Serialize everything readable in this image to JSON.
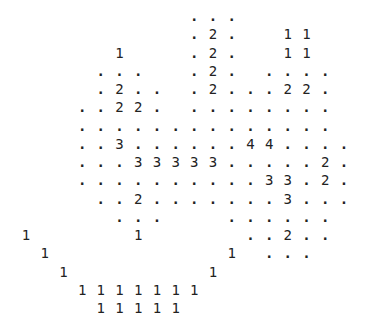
{
  "grid": {
    "origin_x": 26,
    "origin_y": 16,
    "col_pitch": 18.7,
    "row_pitch": 18.25,
    "rows": [
      {
        "cells": [
          [
            9,
            "."
          ],
          [
            10,
            "."
          ],
          [
            11,
            "."
          ]
        ]
      },
      {
        "cells": [
          [
            9,
            "."
          ],
          [
            10,
            "2"
          ],
          [
            11,
            "."
          ],
          [
            14,
            "1"
          ],
          [
            15,
            "1"
          ]
        ]
      },
      {
        "cells": [
          [
            5,
            "1"
          ],
          [
            9,
            "."
          ],
          [
            10,
            "2"
          ],
          [
            11,
            "."
          ],
          [
            14,
            "1"
          ],
          [
            15,
            "1"
          ]
        ]
      },
      {
        "cells": [
          [
            4,
            "."
          ],
          [
            5,
            "."
          ],
          [
            6,
            "."
          ],
          [
            9,
            "."
          ],
          [
            10,
            "2"
          ],
          [
            11,
            "."
          ],
          [
            13,
            "."
          ],
          [
            14,
            "."
          ],
          [
            15,
            "."
          ],
          [
            16,
            "."
          ]
        ]
      },
      {
        "cells": [
          [
            4,
            "."
          ],
          [
            5,
            "2"
          ],
          [
            6,
            "."
          ],
          [
            7,
            "."
          ],
          [
            9,
            "."
          ],
          [
            10,
            "2"
          ],
          [
            11,
            "."
          ],
          [
            12,
            "."
          ],
          [
            13,
            "."
          ],
          [
            14,
            "2"
          ],
          [
            15,
            "2"
          ],
          [
            16,
            "."
          ]
        ]
      },
      {
        "cells": [
          [
            3,
            "."
          ],
          [
            4,
            "."
          ],
          [
            5,
            "2"
          ],
          [
            6,
            "2"
          ],
          [
            7,
            "."
          ],
          [
            9,
            "."
          ],
          [
            10,
            "."
          ],
          [
            11,
            "."
          ],
          [
            12,
            "."
          ],
          [
            13,
            "."
          ],
          [
            14,
            "."
          ],
          [
            15,
            "."
          ],
          [
            16,
            "."
          ]
        ]
      },
      {
        "cells": [
          [
            3,
            "."
          ],
          [
            4,
            "."
          ],
          [
            5,
            "."
          ],
          [
            6,
            "."
          ],
          [
            7,
            "."
          ],
          [
            8,
            "."
          ],
          [
            9,
            "."
          ],
          [
            10,
            "."
          ],
          [
            11,
            "."
          ],
          [
            12,
            "."
          ],
          [
            13,
            "."
          ],
          [
            14,
            "."
          ],
          [
            15,
            "."
          ],
          [
            16,
            "."
          ]
        ]
      },
      {
        "cells": [
          [
            3,
            "."
          ],
          [
            4,
            "."
          ],
          [
            5,
            "3"
          ],
          [
            6,
            "."
          ],
          [
            7,
            "."
          ],
          [
            8,
            "."
          ],
          [
            9,
            "."
          ],
          [
            10,
            "."
          ],
          [
            11,
            "."
          ],
          [
            12,
            "4"
          ],
          [
            13,
            "4"
          ],
          [
            14,
            "."
          ],
          [
            15,
            "."
          ],
          [
            16,
            "."
          ],
          [
            17,
            "."
          ]
        ]
      },
      {
        "cells": [
          [
            3,
            "."
          ],
          [
            4,
            "."
          ],
          [
            5,
            "."
          ],
          [
            6,
            "3"
          ],
          [
            7,
            "3"
          ],
          [
            8,
            "3"
          ],
          [
            9,
            "3"
          ],
          [
            10,
            "3"
          ],
          [
            11,
            "."
          ],
          [
            12,
            "."
          ],
          [
            13,
            "."
          ],
          [
            14,
            "."
          ],
          [
            15,
            "."
          ],
          [
            16,
            "2"
          ],
          [
            17,
            "."
          ]
        ]
      },
      {
        "cells": [
          [
            3,
            "."
          ],
          [
            4,
            "."
          ],
          [
            5,
            "."
          ],
          [
            6,
            "."
          ],
          [
            7,
            "."
          ],
          [
            8,
            "."
          ],
          [
            9,
            "."
          ],
          [
            10,
            "."
          ],
          [
            11,
            "."
          ],
          [
            12,
            "."
          ],
          [
            13,
            "3"
          ],
          [
            14,
            "3"
          ],
          [
            15,
            "."
          ],
          [
            16,
            "2"
          ],
          [
            17,
            "."
          ]
        ]
      },
      {
        "cells": [
          [
            4,
            "."
          ],
          [
            5,
            "."
          ],
          [
            6,
            "2"
          ],
          [
            7,
            "."
          ],
          [
            8,
            "."
          ],
          [
            9,
            "."
          ],
          [
            10,
            "."
          ],
          [
            11,
            "."
          ],
          [
            12,
            "."
          ],
          [
            13,
            "."
          ],
          [
            14,
            "3"
          ],
          [
            15,
            "."
          ],
          [
            16,
            "."
          ],
          [
            17,
            "."
          ]
        ]
      },
      {
        "cells": [
          [
            5,
            "."
          ],
          [
            6,
            "."
          ],
          [
            7,
            "."
          ],
          [
            11,
            "."
          ],
          [
            12,
            "."
          ],
          [
            13,
            "."
          ],
          [
            14,
            "."
          ],
          [
            15,
            "."
          ],
          [
            16,
            "."
          ]
        ]
      },
      {
        "cells": [
          [
            0,
            "1"
          ],
          [
            6,
            "1"
          ],
          [
            12,
            "."
          ],
          [
            13,
            "."
          ],
          [
            14,
            "2"
          ],
          [
            15,
            "."
          ],
          [
            16,
            "."
          ]
        ]
      },
      {
        "cells": [
          [
            1,
            "1"
          ],
          [
            11,
            "1"
          ],
          [
            13,
            "."
          ],
          [
            14,
            "."
          ],
          [
            15,
            "."
          ]
        ]
      },
      {
        "cells": [
          [
            2,
            "1"
          ],
          [
            10,
            "1"
          ]
        ]
      },
      {
        "cells": [
          [
            3,
            "1"
          ],
          [
            4,
            "1"
          ],
          [
            5,
            "1"
          ],
          [
            6,
            "1"
          ],
          [
            7,
            "1"
          ],
          [
            8,
            "1"
          ],
          [
            9,
            "1"
          ]
        ]
      },
      {
        "cells": [
          [
            4,
            "1"
          ],
          [
            5,
            "1"
          ],
          [
            6,
            "1"
          ],
          [
            7,
            "1"
          ],
          [
            8,
            "1"
          ]
        ]
      }
    ]
  }
}
